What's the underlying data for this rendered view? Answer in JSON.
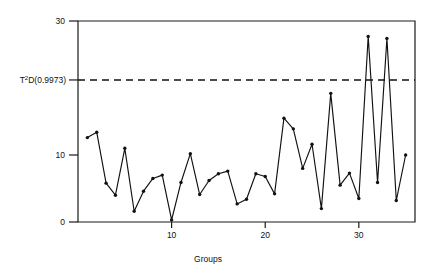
{
  "chart_data": {
    "type": "line",
    "title": "",
    "subtitle": "",
    "xlabel": "Groups",
    "ylabel": "",
    "xlim": [
      0,
      36
    ],
    "ylim": [
      0,
      30
    ],
    "grid": false,
    "legend_position": "none",
    "x_ticks": [
      10,
      20,
      30
    ],
    "x_tick_labels": [
      "10",
      "20",
      "30"
    ],
    "y_ticks": [
      0,
      10,
      30
    ],
    "y_tick_labels": [
      "0",
      "10",
      "30"
    ],
    "annotations": [
      {
        "name": "control-limit",
        "label": "T2D(0.9973)",
        "label_base": "T",
        "label_sup": "2",
        "label_rest": "D(0.9973)",
        "value": 21.2,
        "style": "dashed"
      }
    ],
    "x": [
      1,
      2,
      3,
      4,
      5,
      6,
      7,
      8,
      9,
      10,
      11,
      12,
      13,
      14,
      15,
      16,
      17,
      18,
      19,
      20,
      21,
      22,
      23,
      24,
      25,
      26,
      27,
      28,
      29,
      30,
      31,
      32,
      33,
      34,
      35
    ],
    "series": [
      {
        "name": "T2 statistic",
        "marker": "filled-circle",
        "values": [
          12.6,
          13.4,
          5.8,
          4.0,
          11.0,
          1.6,
          4.6,
          6.5,
          7.0,
          0.3,
          5.9,
          10.2,
          4.1,
          6.2,
          7.2,
          7.6,
          2.7,
          3.4,
          7.2,
          6.8,
          4.2,
          15.5,
          13.9,
          8.0,
          11.6,
          2.0,
          19.2,
          5.5,
          7.3,
          3.5,
          27.7,
          5.9,
          27.4,
          3.2,
          10.0
        ]
      }
    ]
  },
  "axes": {
    "y_axis_name": "t2-value-axis",
    "x_axis_name": "groups-axis"
  }
}
